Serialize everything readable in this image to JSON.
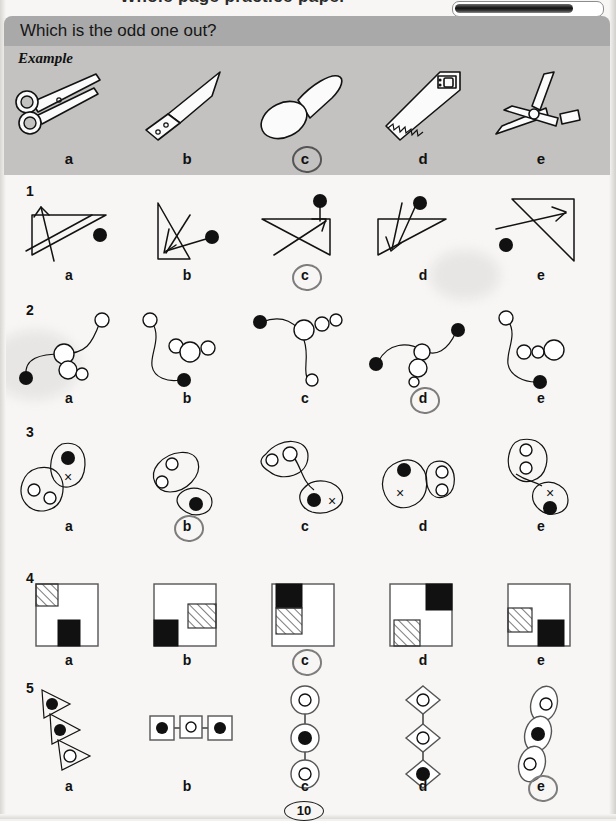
{
  "page": {
    "number": "10",
    "cutoff_heading": "Whole page practice paper",
    "colors": {
      "header_band": "#a9a9a9",
      "example_band": "#c3c2c0",
      "paper": "#f7f6f4",
      "ink": "#121212",
      "pen_mark": "#7d7d7d"
    }
  },
  "header": {
    "question": "Which is the odd one out?",
    "pen_bar_name": "black-pen"
  },
  "example": {
    "label": "Example",
    "letters": [
      "a",
      "b",
      "c",
      "d",
      "e"
    ],
    "answer": "c",
    "items": [
      {
        "letter": "a",
        "icon": "scissors"
      },
      {
        "letter": "b",
        "icon": "knife"
      },
      {
        "letter": "c",
        "icon": "spoon"
      },
      {
        "letter": "d",
        "icon": "saw"
      },
      {
        "letter": "e",
        "icon": "shears"
      }
    ]
  },
  "questions": [
    {
      "number": "1",
      "letters": [
        "a",
        "b",
        "c",
        "d",
        "e"
      ],
      "answer": "c",
      "description": "triangle with arrow and filled dot"
    },
    {
      "number": "2",
      "letters": [
        "a",
        "b",
        "c",
        "d",
        "e"
      ],
      "answer": "d",
      "description": "curved line with open circles and filled endpoint"
    },
    {
      "number": "3",
      "letters": [
        "a",
        "b",
        "c",
        "d",
        "e"
      ],
      "answer": "b",
      "description": "two blobs containing circles, dot and cross"
    },
    {
      "number": "4",
      "letters": [
        "a",
        "b",
        "c",
        "d",
        "e"
      ],
      "answer": "c",
      "description": "square grid with hatched and black cells"
    },
    {
      "number": "5",
      "letters": [
        "a",
        "b",
        "c",
        "d",
        "e"
      ],
      "answer": "e",
      "description": "chain of shapes with filled and open dots"
    }
  ]
}
